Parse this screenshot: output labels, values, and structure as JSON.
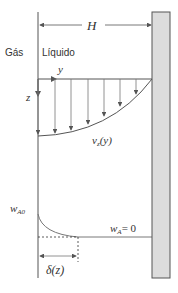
{
  "diagram": {
    "title": "",
    "labels": {
      "width": "H",
      "gas": "Gás",
      "liquid": "Líquido",
      "y_axis": "y",
      "z_axis": "z",
      "velocity_profile": "v_z(y)",
      "velocity_main": "v",
      "velocity_sub": "z",
      "velocity_arg": "(y)",
      "interface_fraction_main": "w",
      "interface_fraction_sub": "A0",
      "bulk_fraction_main": "w",
      "bulk_fraction_sub": "A",
      "bulk_fraction_value": "= 0",
      "boundary_layer": "δ(z)"
    },
    "colors": {
      "line": "#555555",
      "wall_fill": "#dcdcdc",
      "wall_stroke": "#555555",
      "text": "#333333"
    }
  }
}
